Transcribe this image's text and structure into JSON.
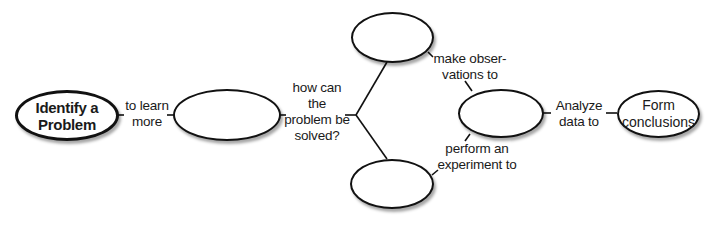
{
  "diagram": {
    "type": "concept-map",
    "nodes": {
      "start": {
        "label": "Identify a\nProblem"
      },
      "research": {
        "label": ""
      },
      "observe": {
        "label": ""
      },
      "experiment": {
        "label": ""
      },
      "analyze": {
        "label": ""
      },
      "end": {
        "label": "Form\nconclusions"
      }
    },
    "links": {
      "to_learn_more": "to learn\nmore",
      "how_solved": "how can\nthe\nproblem be\nsolved?",
      "make_observations": "make obser-\nvations to",
      "perform_experiment": "perform an\nexperiment to",
      "analyze_data": "Analyze\ndata to"
    }
  }
}
